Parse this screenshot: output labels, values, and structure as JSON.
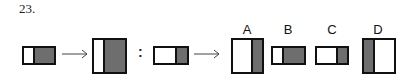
{
  "question": {
    "number": "23."
  },
  "relation": {
    "separator": ":",
    "arrow_glyph": "→"
  },
  "figures": {
    "fig1": {
      "desc": "wide short rectangle, left narrow white, right wide gray",
      "white_ratio": 0.3,
      "gray_side": "right"
    },
    "fig2": {
      "desc": "tall square, left narrow white, right wide gray",
      "white_ratio": 0.3,
      "gray_side": "right"
    },
    "fig3": {
      "desc": "wide short rectangle, left wide white, right narrow gray",
      "gray_ratio": 0.3,
      "gray_side": "right"
    }
  },
  "options": [
    {
      "label": "A",
      "desc": "tall square, left wide white, right narrow gray",
      "gray_side": "right"
    },
    {
      "label": "B",
      "desc": "wide short rectangle, left narrow white, right wide gray",
      "gray_side": "right"
    },
    {
      "label": "C",
      "desc": "wide short rectangle, left wide white, right narrow gray",
      "gray_side": "right"
    },
    {
      "label": "D",
      "desc": "tall square, left narrow gray, right wide white",
      "gray_side": "left"
    }
  ],
  "colors": {
    "fill_gray": "#6e6e6e",
    "border": "#111111",
    "background": "#ffffff"
  }
}
